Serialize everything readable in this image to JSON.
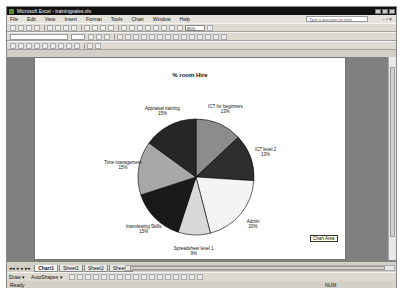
{
  "window": {
    "title": "Microsoft Excel - trainingsales.xls"
  },
  "menubar": {
    "items": [
      "File",
      "Edit",
      "View",
      "Insert",
      "Format",
      "Tools",
      "Chart",
      "Window",
      "Help"
    ],
    "help_placeholder": "Type a question for help",
    "controls": "- ▫ ×"
  },
  "toolbar": {
    "zoom": "85%"
  },
  "chart": {
    "title": "% room Hire",
    "tooltip": "Chart Area"
  },
  "chart_data": {
    "type": "pie",
    "title": "% room Hire",
    "categories": [
      "ICT for beginners",
      "ICT level 2",
      "Admin",
      "Spreadsheet level 1",
      "Interviewing Skills",
      "Time management",
      "Appraisal training"
    ],
    "values": [
      13,
      13,
      20,
      9,
      15,
      15,
      15
    ],
    "labels": [
      "13%",
      "13%",
      "20%",
      "9%",
      "15%",
      "15%",
      "15%"
    ],
    "colors": [
      "#8c8c8c",
      "#2e2e2e",
      "#f4f4f4",
      "#d8d8d8",
      "#1a1a1a",
      "#a8a8a8",
      "#262626"
    ],
    "legend": "none",
    "data_labels": "category and percentage"
  },
  "sheet_tabs": {
    "tabs": [
      "Chart1",
      "Sheet1",
      "Sheet2",
      "Sheet3"
    ],
    "active": "Chart1",
    "nav": "◂◂ ◂ ▸ ▸▸"
  },
  "drawbar": {
    "draw": "Draw ▾",
    "autoshapes": "AutoShapes ▾"
  },
  "status": {
    "left": "Ready",
    "num": "NUM"
  }
}
